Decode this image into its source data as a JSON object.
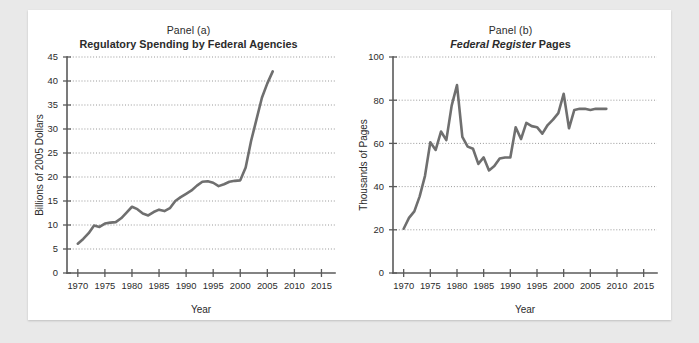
{
  "figure": {
    "background_color": "#e9e9e9",
    "paper_color": "#ffffff",
    "line_color": "#6f6f6f",
    "axis_color": "#5a5a5a",
    "grid_color": "#8d8d8d"
  },
  "panels": [
    {
      "id": "panel-a",
      "label": "Panel (a)",
      "title_plain": "Regulatory Spending by Federal Agencies",
      "title_italic": "",
      "title_tail": ""
    },
    {
      "id": "panel-b",
      "label": "Panel (b)",
      "title_plain": "",
      "title_italic": "Federal Register",
      "title_tail": " Pages"
    }
  ],
  "chart_data": [
    {
      "type": "line",
      "title": "Regulatory Spending by Federal Agencies",
      "subtitle": "Panel (a)",
      "xlabel": "Year",
      "ylabel": "Billions of 2005 Dollars",
      "xlim": [
        1968,
        2017.5
      ],
      "ylim": [
        0,
        45
      ],
      "xticks": [
        1970,
        1975,
        1980,
        1985,
        1990,
        1995,
        2000,
        2005,
        2010,
        2015
      ],
      "yticks": [
        0,
        5,
        10,
        15,
        20,
        25,
        30,
        35,
        40,
        45
      ],
      "grid": "horizontal-dotted",
      "legend": "none",
      "x": [
        1970,
        1971,
        1972,
        1973,
        1974,
        1975,
        1976,
        1977,
        1978,
        1979,
        1980,
        1981,
        1982,
        1983,
        1984,
        1985,
        1986,
        1987,
        1988,
        1989,
        1990,
        1991,
        1992,
        1993,
        1994,
        1995,
        1996,
        1997,
        1998,
        1999,
        2000,
        2001,
        2002,
        2003,
        2004,
        2005,
        2006
      ],
      "values": [
        6.1,
        7.1,
        8.3,
        9.9,
        9.6,
        10.3,
        10.5,
        10.6,
        11.4,
        12.6,
        13.8,
        13.3,
        12.4,
        12.0,
        12.7,
        13.2,
        12.9,
        13.5,
        15.0,
        15.8,
        16.5,
        17.2,
        18.2,
        19.0,
        19.1,
        18.8,
        18.1,
        18.5,
        19.0,
        19.2,
        19.3,
        22.0,
        27.5,
        32.0,
        36.5,
        39.5,
        42.0
      ]
    },
    {
      "type": "line",
      "title": "Federal Register Pages",
      "subtitle": "Panel (b)",
      "xlabel": "Year",
      "ylabel": "Thousands of Pages",
      "xlim": [
        1968,
        2017.5
      ],
      "ylim": [
        0,
        100
      ],
      "xticks": [
        1970,
        1975,
        1980,
        1985,
        1990,
        1995,
        2000,
        2005,
        2010,
        2015
      ],
      "yticks": [
        0,
        20,
        40,
        60,
        80,
        100
      ],
      "grid": "horizontal-dotted",
      "legend": "none",
      "x": [
        1970,
        1971,
        1972,
        1973,
        1974,
        1975,
        1976,
        1977,
        1978,
        1979,
        1980,
        1981,
        1982,
        1983,
        1984,
        1985,
        1986,
        1987,
        1988,
        1989,
        1990,
        1991,
        1992,
        1993,
        1994,
        1995,
        1996,
        1997,
        1998,
        1999,
        2000,
        2001,
        2002,
        2003,
        2004,
        2005,
        2006,
        2007,
        2008
      ],
      "values": [
        20.5,
        25.5,
        28.5,
        35.5,
        45.0,
        60.5,
        57.0,
        65.5,
        61.5,
        77.5,
        87.0,
        63.0,
        58.5,
        57.5,
        50.5,
        53.5,
        47.5,
        49.5,
        53.0,
        53.5,
        53.5,
        67.5,
        62.0,
        69.5,
        68.0,
        67.5,
        64.5,
        68.5,
        71.0,
        74.0,
        83.0,
        67.0,
        75.5,
        76.0,
        76.0,
        75.5,
        76.0,
        76.0,
        76.0
      ]
    }
  ]
}
